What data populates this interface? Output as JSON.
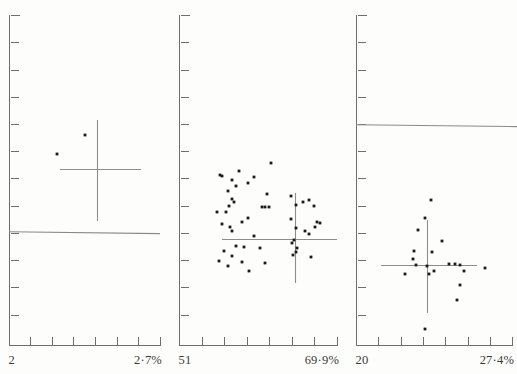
{
  "figure": {
    "type": "multi-panel-scatter",
    "panel_count": 3,
    "background_color": "#fdfdfc",
    "point_color": "#1b1b1b",
    "axis_color": "#6e6e6e",
    "line_color": "#8a8a8a"
  },
  "chart_data": [
    {
      "type": "scatter",
      "panel_index": 0,
      "title": "",
      "xlabel": "",
      "ylabel": "",
      "x_axis_min_label": "2",
      "x_axis_max_label": "2·7%",
      "xlim": [
        2.0,
        2.7
      ],
      "grid": false,
      "legend": "none",
      "n_points": 2,
      "x": [
        0.318,
        0.585
      ],
      "y": [
        0.632,
        0.548
      ],
      "points_px": [
        [
          57,
          154
        ],
        [
          85,
          135
        ]
      ],
      "crosshair": {
        "center_px": [
          97,
          169
        ],
        "h_extent_px": [
          60,
          141
        ],
        "v_extent_px": [
          120,
          221
        ]
      },
      "reference_line": {
        "y_px": 233,
        "x_start_px": 9,
        "x_end_px": 160
      },
      "y_ticks_px": [
        15,
        42,
        70,
        97,
        124,
        151,
        178,
        206,
        233,
        260,
        287,
        315,
        345
      ],
      "x_ticks_px": [
        9,
        30,
        52,
        73,
        95,
        117,
        138,
        160
      ]
    },
    {
      "type": "scatter",
      "panel_index": 1,
      "title": "",
      "xlabel": "",
      "ylabel": "",
      "x_axis_min_label": "51",
      "x_axis_max_label": "69·9%",
      "xlim": [
        51.0,
        69.9
      ],
      "grid": false,
      "legend": "none",
      "n_points": 52,
      "points_px": [
        [
          271,
          163
        ],
        [
          239,
          171
        ],
        [
          220,
          175
        ],
        [
          222,
          176
        ],
        [
          254,
          177
        ],
        [
          232,
          180
        ],
        [
          248,
          183
        ],
        [
          236,
          186
        ],
        [
          228,
          191
        ],
        [
          267,
          194
        ],
        [
          291,
          196
        ],
        [
          232,
          199
        ],
        [
          234,
          202
        ],
        [
          303,
          202
        ],
        [
          309,
          200
        ],
        [
          296,
          205
        ],
        [
          229,
          206
        ],
        [
          262,
          207
        ],
        [
          265,
          207
        ],
        [
          269,
          207
        ],
        [
          314,
          206
        ],
        [
          217,
          212
        ],
        [
          226,
          212
        ],
        [
          248,
          218
        ],
        [
          291,
          219
        ],
        [
          242,
          222
        ],
        [
          222,
          224
        ],
        [
          230,
          227
        ],
        [
          317,
          222
        ],
        [
          320,
          223
        ],
        [
          315,
          227
        ],
        [
          296,
          228
        ],
        [
          232,
          231
        ],
        [
          305,
          231
        ],
        [
          309,
          234
        ],
        [
          254,
          236
        ],
        [
          294,
          240
        ],
        [
          292,
          243
        ],
        [
          236,
          246
        ],
        [
          244,
          247
        ],
        [
          260,
          248
        ],
        [
          224,
          251
        ],
        [
          293,
          255
        ],
        [
          296,
          252
        ],
        [
          232,
          256
        ],
        [
          311,
          257
        ],
        [
          219,
          261
        ],
        [
          242,
          262
        ],
        [
          265,
          263
        ],
        [
          228,
          266
        ],
        [
          249,
          271
        ],
        [
          297,
          248
        ]
      ],
      "crosshair": {
        "center_px": [
          295,
          239
        ],
        "h_extent_px": [
          222,
          337
        ],
        "v_extent_px": [
          193,
          283
        ]
      },
      "y_ticks_px": [
        15,
        42,
        70,
        97,
        124,
        151,
        178,
        206,
        233,
        260,
        287,
        315,
        345
      ],
      "x_ticks_px": [
        179,
        202,
        224,
        247,
        269,
        292,
        314,
        337
      ]
    },
    {
      "type": "scatter",
      "panel_index": 2,
      "title": "",
      "xlabel": "",
      "ylabel": "",
      "x_axis_min_label": "20",
      "x_axis_max_label": "27·4%",
      "xlim": [
        20.0,
        27.4
      ],
      "grid": false,
      "legend": "none",
      "n_points": 19,
      "points_px": [
        [
          431,
          200
        ],
        [
          425,
          218
        ],
        [
          418,
          230
        ],
        [
          442,
          241
        ],
        [
          414,
          251
        ],
        [
          432,
          252
        ],
        [
          413,
          259
        ],
        [
          416,
          265
        ],
        [
          427,
          266
        ],
        [
          449,
          264
        ],
        [
          455,
          264
        ],
        [
          460,
          265
        ],
        [
          434,
          271
        ],
        [
          464,
          271
        ],
        [
          405,
          274
        ],
        [
          429,
          274
        ],
        [
          485,
          268
        ],
        [
          460,
          285
        ],
        [
          457,
          300
        ],
        [
          425,
          329
        ]
      ],
      "crosshair": {
        "center_px": [
          427,
          265
        ],
        "h_extent_px": [
          381,
          477
        ],
        "v_extent_px": [
          220,
          313
        ]
      },
      "reference_line": {
        "y_px": 126,
        "x_start_px": 356,
        "x_end_px": 517
      },
      "y_ticks_px": [
        15,
        42,
        70,
        97,
        124,
        151,
        178,
        206,
        233,
        260,
        287,
        315,
        345
      ],
      "x_ticks_px": [
        356,
        378,
        401,
        423,
        445,
        468,
        490,
        512
      ]
    }
  ],
  "labels": {
    "panel0_left": "2",
    "panel0_right": "2·7%",
    "panel1_left": "51",
    "panel1_right": "69·9%",
    "panel2_left": "20",
    "panel2_right": "27·4%"
  }
}
